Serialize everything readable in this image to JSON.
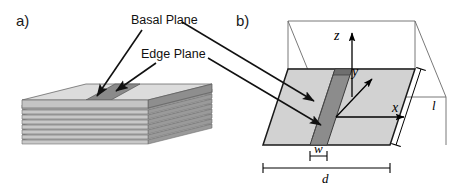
{
  "figure": {
    "width": 453,
    "height": 186,
    "background": "#ffffff"
  },
  "panels": {
    "a": {
      "letter": "a)",
      "description": "Stacked graphite sheets showing basal and edge planes",
      "layer_count": 9
    },
    "b": {
      "letter": "b)",
      "description": "Idealized rectangular box model with coordinate axes and dimensions"
    }
  },
  "callouts": {
    "basal_plane": "Basal Plane",
    "edge_plane": "Edge Plane"
  },
  "axes": {
    "z": "z",
    "y": "y",
    "x": "x"
  },
  "dimensions": {
    "w": "w",
    "d": "d",
    "l": "l"
  },
  "colors": {
    "basal_face": "#d6d6d6",
    "basal_face_light": "#e4e4e4",
    "edge_band": "#8a8a8a",
    "edge_band_dark": "#6f6f6f",
    "floor": "#d2d2d2",
    "outline": "#1a1a1a",
    "wire": "#555555",
    "text": "#111111"
  }
}
